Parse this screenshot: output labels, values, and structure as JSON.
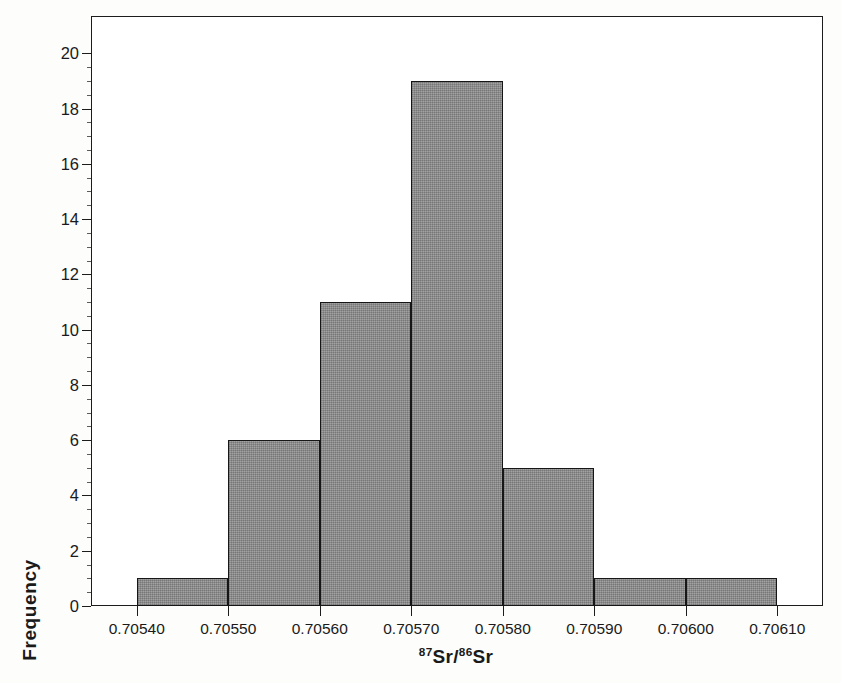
{
  "chart_data": {
    "type": "bar",
    "title": "",
    "subtitle": "",
    "xlabel": "87Sr/86Sr",
    "xlabel_parts": {
      "sup1": "87",
      "base1": "Sr/",
      "sup2": "86",
      "base2": "Sr"
    },
    "ylabel": "Frequency",
    "categories": [
      "0.70540-0.70550",
      "0.70550-0.70560",
      "0.70560-0.70570",
      "0.70570-0.70580",
      "0.70580-0.70590",
      "0.70590-0.70600",
      "0.70600-0.70610"
    ],
    "bin_edges": [
      0.7054,
      0.7055,
      0.7056,
      0.7057,
      0.7058,
      0.7059,
      0.706,
      0.7061
    ],
    "values": [
      1,
      6,
      11,
      19,
      5,
      1,
      1
    ],
    "bin_width": 0.0001,
    "xlim": [
      0.70535,
      0.70615
    ],
    "ylim": [
      0,
      21.35
    ],
    "x_ticks": [
      0.7054,
      0.7055,
      0.7056,
      0.7057,
      0.7058,
      0.7059,
      0.706,
      0.7061
    ],
    "x_tick_labels": [
      "0.70540",
      "0.70550",
      "0.70560",
      "0.70570",
      "0.70580",
      "0.70590",
      "0.70600",
      "0.70610"
    ],
    "y_ticks": [
      0,
      2,
      4,
      6,
      8,
      10,
      12,
      14,
      16,
      18,
      20
    ],
    "y_tick_labels": [
      "0",
      "2",
      "4",
      "6",
      "8",
      "10",
      "12",
      "14",
      "16",
      "18",
      "20"
    ],
    "y_minor_step": 0.5,
    "grid": false,
    "legend": null,
    "legend_position": "none",
    "total_count": 44,
    "colors": {
      "bar_fill": "#939393",
      "bar_edge": "#161616",
      "axis": "#1c1c1c",
      "text": "#1a1a1a",
      "background": "#ffffff"
    }
  }
}
